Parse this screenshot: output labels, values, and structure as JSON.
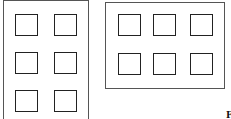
{
  "diagram": {
    "left_panel": {
      "orientation": "portrait",
      "columns": 2,
      "rows": 3
    },
    "right_panel": {
      "orientation": "landscape",
      "columns": 3,
      "rows": 2
    },
    "corner_label": "F"
  }
}
